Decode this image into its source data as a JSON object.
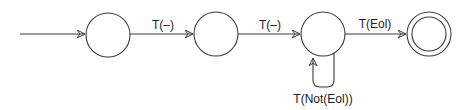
{
  "diagram": {
    "type": "finite-state-automaton",
    "states": [
      {
        "id": "s0",
        "label": "",
        "accepting": false,
        "initial": true
      },
      {
        "id": "s1",
        "label": "",
        "accepting": false
      },
      {
        "id": "s2",
        "label": "",
        "accepting": false
      },
      {
        "id": "s3",
        "label": "",
        "accepting": true
      }
    ],
    "transitions": [
      {
        "from": "start",
        "to": "s0",
        "label": ""
      },
      {
        "from": "s0",
        "to": "s1",
        "label": "T(–)"
      },
      {
        "from": "s1",
        "to": "s2",
        "label": "T(–)"
      },
      {
        "from": "s2",
        "to": "s3",
        "label": "T(Eol)"
      },
      {
        "from": "s2",
        "to": "s2",
        "label": "T(Not(Eol))"
      }
    ]
  },
  "colors": {
    "line": "#3a3a3a",
    "text": "#222222",
    "background": "#ffffff"
  }
}
